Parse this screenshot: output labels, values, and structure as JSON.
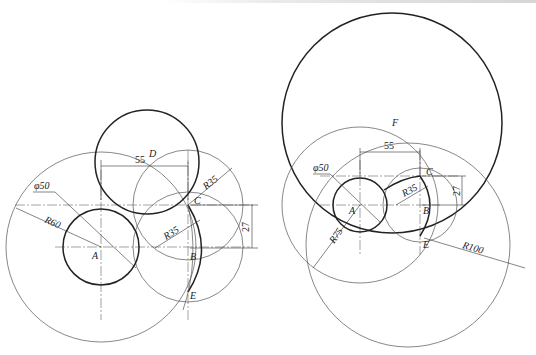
{
  "figure": {
    "header_text_cropped": true,
    "left_drawing": {
      "points": {
        "A": "A",
        "B": "B",
        "C": "C",
        "D": "D",
        "E": "E"
      },
      "dimensions": {
        "small_circle_dia": "φ50",
        "outer_radius": "R60",
        "horizontal_distance": "55",
        "vertical_distance": "27",
        "arc_radius_1": "R35",
        "arc_radius_2": "R35"
      }
    },
    "right_drawing": {
      "points": {
        "A": "A",
        "B": "B",
        "C": "C",
        "E": "E",
        "F": "F"
      },
      "dimensions": {
        "small_circle_dia": "φ50",
        "horizontal_distance": "55",
        "vertical_distance": "27",
        "arc_radius": "R35",
        "construction_radius_1": "R75",
        "construction_radius_2": "R100"
      }
    }
  }
}
